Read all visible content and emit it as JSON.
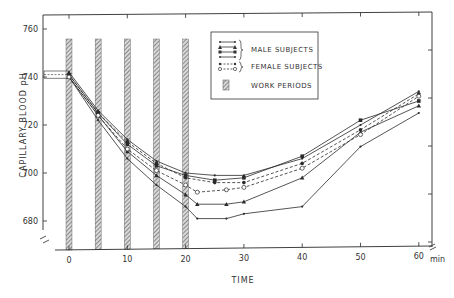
{
  "chart_data": {
    "type": "line",
    "title": "",
    "xlabel": "TIME",
    "x_unit": "min",
    "ylabel": "CAPILLARY BLOOD pH",
    "xlim": [
      0,
      60
    ],
    "ylim": [
      6.7,
      7.6
    ],
    "x_ticks": [
      0,
      10,
      20,
      30,
      40,
      50,
      60
    ],
    "x_tick_labels": [
      "0",
      "10",
      "20",
      "30",
      "40",
      "50",
      "60"
    ],
    "y_ticks": [
      6.8,
      7.0,
      7.2,
      7.4,
      7.6
    ],
    "y_tick_labels": [
      "680",
      "700",
      "720",
      "740",
      "760"
    ],
    "grid": false,
    "legend_position": "upper-center",
    "legend": [
      {
        "label": "MALE SUBJECTS",
        "markers": [
          "small-dot",
          "triangle",
          "square",
          "small-dot"
        ],
        "style": "solid"
      },
      {
        "label": "FEMALE SUBJECTS",
        "markers": [
          "filled-circle",
          "open-circle"
        ],
        "style": "dashed"
      },
      {
        "label": "WORK PERIODS",
        "markers": [
          "hatched-bar"
        ],
        "style": "bar"
      }
    ],
    "work_periods": [
      {
        "start": 0,
        "end": 1
      },
      {
        "start": 5,
        "end": 6
      },
      {
        "start": 10,
        "end": 11
      },
      {
        "start": 15,
        "end": 16
      },
      {
        "start": 20,
        "end": 21
      }
    ],
    "series": [
      {
        "name": "Male 1",
        "group": "male",
        "marker": "small-dot",
        "dash": false,
        "x": [
          0,
          5,
          10,
          15,
          20,
          22,
          27,
          30,
          40,
          50,
          60
        ],
        "values": [
          7.4,
          7.22,
          7.06,
          6.95,
          6.86,
          6.81,
          6.81,
          6.83,
          6.86,
          7.11,
          7.25
        ]
      },
      {
        "name": "Male 2",
        "group": "male",
        "marker": "triangle",
        "dash": false,
        "x": [
          0,
          5,
          10,
          15,
          20,
          22,
          27,
          30,
          40,
          50,
          60
        ],
        "values": [
          7.4,
          7.24,
          7.09,
          6.99,
          6.91,
          6.87,
          6.87,
          6.88,
          6.98,
          7.17,
          7.28
        ]
      },
      {
        "name": "Male 3",
        "group": "male",
        "marker": "square",
        "dash": false,
        "x": [
          0,
          5,
          10,
          15,
          20,
          25,
          30,
          40,
          50,
          60
        ],
        "values": [
          7.41,
          7.25,
          7.12,
          7.03,
          6.99,
          6.97,
          6.98,
          7.07,
          7.22,
          7.3
        ]
      },
      {
        "name": "Male 4",
        "group": "male",
        "marker": "small-dot",
        "dash": false,
        "x": [
          0,
          5,
          10,
          15,
          20,
          25,
          30,
          40,
          50,
          60
        ],
        "values": [
          7.42,
          7.26,
          7.14,
          7.05,
          7.0,
          6.99,
          6.99,
          7.06,
          7.2,
          7.34
        ]
      },
      {
        "name": "Female 1",
        "group": "female",
        "marker": "filled-circle",
        "dash": true,
        "x": [
          0,
          5,
          10,
          15,
          20,
          25,
          30,
          40,
          50,
          60
        ],
        "values": [
          7.41,
          7.25,
          7.13,
          7.04,
          6.98,
          6.96,
          6.96,
          7.04,
          7.18,
          7.33
        ]
      },
      {
        "name": "Female 2",
        "group": "female",
        "marker": "open-circle",
        "dash": true,
        "x": [
          0,
          5,
          10,
          15,
          20,
          22,
          27,
          30,
          40,
          50,
          60
        ],
        "values": [
          7.4,
          7.24,
          7.1,
          7.01,
          6.95,
          6.92,
          6.93,
          6.94,
          7.02,
          7.16,
          7.32
        ]
      }
    ]
  },
  "labels": {
    "ylabel": "CAPILLARY BLOOD pH",
    "xlabel": "TIME",
    "x_unit": "min",
    "legend_male": "MALE SUBJECTS",
    "legend_female": "FEMALE SUBJECTS",
    "legend_work": "WORK PERIODS"
  },
  "colors": {
    "ink": "#2a2a2a",
    "bar_fill": "#9a9a9a",
    "background": "#ffffff"
  }
}
